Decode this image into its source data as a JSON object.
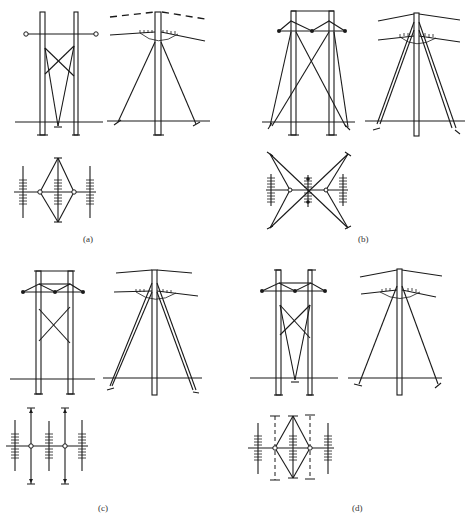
{
  "figure": {
    "panels": [
      {
        "id": "a",
        "label": "(a)",
        "description": "Two-pole H-frame tower with X-bracing, side view with guy wires, and plan view with diamond guying layout"
      },
      {
        "id": "b",
        "label": "(b)",
        "description": "Two-pole portal tower with crossed external guy wires, side view, and plan view with X-shaped four-anchor guying"
      },
      {
        "id": "c",
        "label": "(c)",
        "description": "Two-pole portal tower with V-crossarm and X-bracing, side view with double guys, plan view with parallel in-line guys"
      },
      {
        "id": "d",
        "label": "(d)",
        "description": "Two-pole tower with V-crossarm and internal V-guys, side view, plan view with diamond and dashed guys"
      }
    ]
  },
  "colors": {
    "line": "#1a1a1a",
    "background": "#ffffff"
  }
}
